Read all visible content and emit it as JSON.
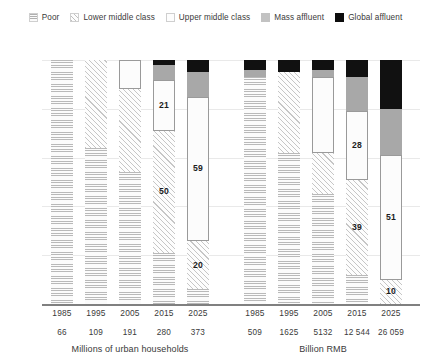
{
  "legend": {
    "items": [
      {
        "label": "Poor",
        "key": "poor",
        "pattern": "horizontal-lines"
      },
      {
        "label": "Lower middle class",
        "key": "lower",
        "pattern": "diagonal-hatch"
      },
      {
        "label": "Upper middle class",
        "key": "upper",
        "pattern": "solid-white"
      },
      {
        "label": "Mass affluent",
        "key": "mass",
        "pattern": "solid-grey"
      },
      {
        "label": "Global affluent",
        "key": "global",
        "pattern": "solid-black"
      }
    ]
  },
  "axes": {
    "ylabel": "Percentage of total",
    "ymin": 0,
    "ymax": 100
  },
  "panels": [
    {
      "caption": "Millions of urban households"
    },
    {
      "caption": "Billion RMB"
    }
  ],
  "chart_data": {
    "type": "bar",
    "title": "",
    "subtitle": "",
    "xlabel": "",
    "ylabel": "Percentage of total",
    "ylim": [
      0,
      100
    ],
    "grid": true,
    "stacked": true,
    "normalized_percent": true,
    "legend_position": "top",
    "legend": [
      "Poor",
      "Lower middle class",
      "Upper middle class",
      "Mass affluent",
      "Global affluent"
    ],
    "panels": [
      {
        "name": "Millions of urban households",
        "caption": "Millions of urban households",
        "categories": [
          "1985",
          "1995",
          "2005",
          "2015",
          "2025"
        ],
        "value_row": [
          "66",
          "109",
          "191",
          "280",
          "373"
        ],
        "series": [
          {
            "name": "Poor",
            "values": [
              100,
              64,
              54,
              21,
              6
            ],
            "labels": [
              "",
              "",
              "",
              "",
              ""
            ]
          },
          {
            "name": "Lower middle class",
            "values": [
              0,
              36,
              34,
              50,
              20
            ],
            "labels": [
              "",
              "",
              "",
              "50",
              "20"
            ]
          },
          {
            "name": "Upper middle class",
            "values": [
              0,
              0,
              12,
              21,
              59
            ],
            "labels": [
              "",
              "",
              "",
              "21",
              "59"
            ]
          },
          {
            "name": "Mass affluent",
            "values": [
              0,
              0,
              0,
              6,
              10
            ],
            "labels": [
              "",
              "",
              "",
              "",
              ""
            ]
          },
          {
            "name": "Global affluent",
            "values": [
              0,
              0,
              0,
              2,
              5
            ],
            "labels": [
              "",
              "",
              "",
              "",
              ""
            ]
          }
        ]
      },
      {
        "name": "Billion RMB",
        "caption": "Billion RMB",
        "categories": [
          "1985",
          "1995",
          "2005",
          "2015",
          "2025"
        ],
        "value_row": [
          "509",
          "1625",
          "5132",
          "12 544",
          "26 059"
        ],
        "series": [
          {
            "name": "Poor",
            "values": [
              93,
              62,
              45,
              12,
              0
            ],
            "labels": [
              "",
              "",
              "",
              "",
              ""
            ]
          },
          {
            "name": "Lower middle class",
            "values": [
              0,
              33,
              17,
              39,
              10
            ],
            "labels": [
              "",
              "",
              "",
              "39",
              "10"
            ]
          },
          {
            "name": "Upper middle class",
            "values": [
              0,
              0,
              31,
              28,
              51
            ],
            "labels": [
              "",
              "",
              "",
              "28",
              "51"
            ]
          },
          {
            "name": "Mass affluent",
            "values": [
              3,
              0,
              3,
              14,
              19
            ],
            "labels": [
              "",
              "",
              "",
              "",
              ""
            ]
          },
          {
            "name": "Global affluent",
            "values": [
              4,
              5,
              4,
              7,
              20
            ],
            "labels": [
              "",
              "",
              "",
              "",
              ""
            ]
          }
        ]
      }
    ]
  }
}
